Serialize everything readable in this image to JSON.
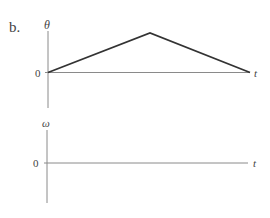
{
  "figure": {
    "label": "b.",
    "top_graph": {
      "ylabel": "θ",
      "xlabel": "t",
      "origin_label": "0",
      "description": "θ rises linearly from 0 to a peak, then decreases linearly back to 0"
    },
    "bottom_graph": {
      "ylabel": "ω",
      "xlabel": "t",
      "origin_label": "0",
      "description": "empty ω vs t axes"
    }
  },
  "colors": {
    "axis": "#888888",
    "curve": "#333333",
    "text": "#444444"
  }
}
